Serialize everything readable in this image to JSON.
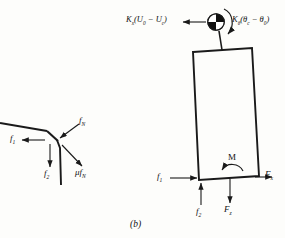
{
  "figure": {
    "caption": "(b)",
    "panels": {
      "left": {
        "name": "contact-force-detail",
        "labels": {
          "f1": "f",
          "f1_sub": "1",
          "f2": "f",
          "f2_sub": "2",
          "fN": "f",
          "fN_sub": "N",
          "mu_fN_prefix": "μf",
          "mu_fN_sub": "N"
        }
      },
      "right": {
        "name": "tilted-body-free-body-diagram",
        "labels": {
          "spring_force": "K",
          "spring_force_sub": "x",
          "spring_force_expr": "(U",
          "spring_force_sub2": "0",
          "spring_force_mid": " − U",
          "spring_force_sub3": "c",
          "spring_force_end": ")",
          "torsion_moment": "K",
          "torsion_moment_sub": "θ",
          "torsion_expr": "(θ",
          "torsion_sub2": "c",
          "torsion_mid": " − θ",
          "torsion_sub3": "0",
          "torsion_end": ")",
          "moment": "M",
          "Fx": "F",
          "Fx_sub": "x",
          "Fz": "F",
          "Fz_sub": "z",
          "f1": "f",
          "f1_sub": "1",
          "f2": "f",
          "f2_sub": "2"
        },
        "pivot_icon": "pin-joint-quadrant-icon"
      }
    },
    "colors": {
      "line": "#1a1a1a",
      "text": "#111111",
      "background": "#fdfdfb"
    }
  }
}
